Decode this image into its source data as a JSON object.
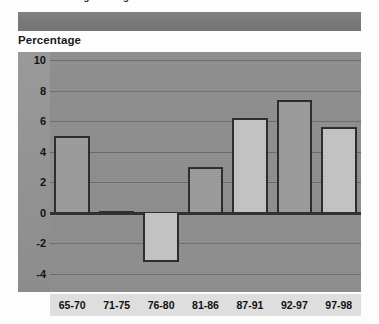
{
  "document": {
    "clipped_heading": "Annual Percentage Change",
    "banner_label": "",
    "axis_title": "Percentage"
  },
  "chart_data": {
    "type": "bar",
    "title": "",
    "subtitle": "",
    "xlabel": "",
    "ylabel": "Percentage",
    "categories": [
      "65-70",
      "71-75",
      "76-80",
      "81-86",
      "87-91",
      "92-97",
      "97-98"
    ],
    "values": [
      5.0,
      0.1,
      -3.2,
      3.0,
      6.2,
      7.4,
      5.6
    ],
    "series": [
      {
        "name": "Percentage",
        "values": [
          5.0,
          0.1,
          -3.2,
          3.0,
          6.2,
          7.4,
          5.6
        ]
      }
    ],
    "ylim": [
      -4,
      10
    ],
    "ytick_labels": [
      "10",
      "8",
      "6",
      "4",
      "2",
      "0",
      "-2",
      "-4"
    ],
    "ytick_values": [
      10,
      8,
      6,
      4,
      2,
      0,
      -2,
      -4
    ],
    "grid": true,
    "legend": "none",
    "zero_line": 0,
    "bar_tones": [
      "tone-a",
      "tone-b",
      "tone-b",
      "tone-a",
      "tone-b",
      "tone-a",
      "tone-b"
    ],
    "colors": {
      "plot_background": "#8e8e8e",
      "gutter_background": "#949494",
      "frame_background": "#bdbdbd",
      "banner": "#7b7b7b",
      "bar_dark": "#9b9b9b",
      "bar_light": "#c3c3c3",
      "bar_outline": "#2b2b2b",
      "gridline": "#6d6d6d",
      "zero_line": "#2f2f2f",
      "label_strip": "#dedede",
      "text": "#101010"
    }
  }
}
